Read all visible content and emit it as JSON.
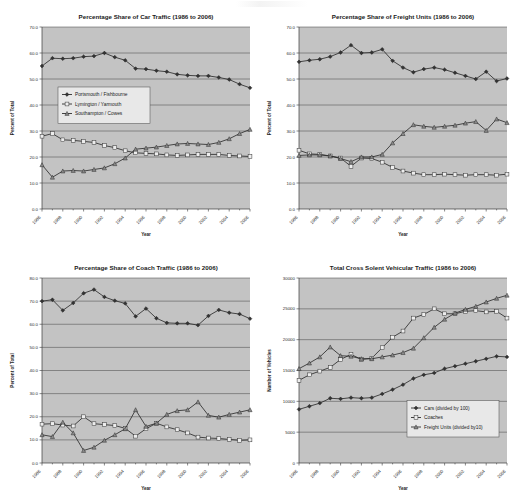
{
  "figure": {
    "name": "cross-solent-traffic-figure",
    "panel_count": 4
  },
  "series_styles": {
    "portsmouth": {
      "marker": "diamond",
      "fill": "#333333",
      "stroke": "#222222"
    },
    "lymington": {
      "marker": "square",
      "fill": "#ededed",
      "stroke": "#333333"
    },
    "southampton": {
      "marker": "triangle",
      "fill": "#8a8a8a",
      "stroke": "#222222"
    }
  },
  "charts": [
    {
      "id": "car-traffic",
      "type": "line",
      "title": "Percentage Share of Car Traffic (1986 to 2006)",
      "xlabel": "Year",
      "ylabel": "Percent of Total",
      "ylim": [
        0,
        70
      ],
      "ytick_step": 10,
      "ytick_labels": [
        "0.0",
        "10.0",
        "20.0",
        "30.0",
        "40.0",
        "50.0",
        "60.0",
        "70.0"
      ],
      "x": [
        1986,
        1987,
        1988,
        1989,
        1990,
        1991,
        1992,
        1993,
        1994,
        1995,
        1996,
        1997,
        1998,
        1999,
        2000,
        2001,
        2002,
        2003,
        2004,
        2005,
        2006
      ],
      "xtick_labels": [
        "1986",
        "1988",
        "1990",
        "1992",
        "1994",
        "1996",
        "1998",
        "2000",
        "2002",
        "2004",
        "2006"
      ],
      "grid": true,
      "legend_position": "upper-left-inside",
      "series": [
        {
          "name": "Portsmouth / Fishbourne",
          "style": "portsmouth",
          "values": [
            55.0,
            58.0,
            57.8,
            58.0,
            58.6,
            58.8,
            60.0,
            58.4,
            57.2,
            54.0,
            53.8,
            53.2,
            52.8,
            51.8,
            51.4,
            51.2,
            51.2,
            50.6,
            49.8,
            48.0,
            46.6
          ]
        },
        {
          "name": "Lymington / Yarmouth",
          "style": "lymington",
          "values": [
            28.0,
            29.0,
            26.6,
            26.4,
            26.0,
            25.6,
            24.4,
            23.6,
            22.4,
            21.6,
            21.4,
            21.2,
            20.8,
            20.6,
            20.8,
            21.0,
            21.0,
            21.0,
            20.6,
            20.4,
            20.2
          ]
        },
        {
          "name": "Southampton / Cowes",
          "style": "southampton",
          "values": [
            17.0,
            12.2,
            14.6,
            14.8,
            14.6,
            15.2,
            15.8,
            17.4,
            19.6,
            23.0,
            23.4,
            23.8,
            24.4,
            25.0,
            25.2,
            25.0,
            24.8,
            25.6,
            27.0,
            29.0,
            30.6
          ]
        }
      ]
    },
    {
      "id": "freight-units",
      "type": "line",
      "title": "Percentage Share of Freight Units (1986 to 2006)",
      "xlabel": "Year",
      "ylabel": "Percent of Total",
      "ylim": [
        0,
        70
      ],
      "ytick_step": 10,
      "ytick_labels": [
        "0.0",
        "10.0",
        "20.0",
        "30.0",
        "40.0",
        "50.0",
        "60.0",
        "70.0"
      ],
      "x": [
        1986,
        1987,
        1988,
        1989,
        1990,
        1991,
        1992,
        1993,
        1994,
        1995,
        1996,
        1997,
        1998,
        1999,
        2000,
        2001,
        2002,
        2003,
        2004,
        2005,
        2006
      ],
      "xtick_labels": [
        "1986",
        "1988",
        "1990",
        "1992",
        "1994",
        "1996",
        "1998",
        "2000",
        "2002",
        "2004",
        "2006"
      ],
      "grid": true,
      "legend_position": "none",
      "series": [
        {
          "name": "Portsmouth / Fishbourne",
          "style": "portsmouth",
          "values": [
            56.6,
            57.2,
            57.6,
            58.6,
            60.2,
            63.0,
            60.0,
            60.2,
            61.4,
            57.0,
            54.4,
            52.6,
            53.8,
            54.4,
            53.6,
            52.4,
            51.2,
            50.0,
            52.8,
            49.2,
            50.2
          ]
        },
        {
          "name": "Lymington / Yarmouth",
          "style": "lymington",
          "values": [
            22.6,
            21.2,
            21.0,
            20.4,
            19.6,
            16.4,
            19.6,
            19.4,
            18.0,
            16.0,
            14.6,
            13.8,
            13.2,
            13.2,
            13.4,
            13.2,
            13.0,
            13.2,
            13.2,
            13.0,
            13.4
          ]
        },
        {
          "name": "Southampton / Cowes",
          "style": "southampton",
          "values": [
            20.6,
            20.8,
            20.8,
            20.4,
            19.4,
            18.2,
            20.0,
            20.0,
            21.0,
            25.4,
            29.0,
            32.4,
            31.8,
            31.4,
            31.8,
            32.2,
            33.0,
            33.6,
            30.2,
            34.6,
            33.2
          ]
        }
      ]
    },
    {
      "id": "coach-traffic",
      "type": "line",
      "title": "Percentage Share of Coach Traffic (1986 to 2006)",
      "xlabel": "Year",
      "ylabel": "Percent of Total",
      "ylim": [
        0,
        80
      ],
      "ytick_step": 10,
      "ytick_labels": [
        "0.0",
        "10.0",
        "20.0",
        "30.0",
        "40.0",
        "50.0",
        "60.0",
        "70.0",
        "80.0"
      ],
      "x": [
        1986,
        1987,
        1988,
        1989,
        1990,
        1991,
        1992,
        1993,
        1994,
        1995,
        1996,
        1997,
        1998,
        1999,
        2000,
        2001,
        2002,
        2003,
        2004,
        2005,
        2006
      ],
      "xtick_labels": [
        "1986",
        "1988",
        "1990",
        "1992",
        "1994",
        "1996",
        "1998",
        "2000",
        "2002",
        "2004",
        "2006"
      ],
      "grid": true,
      "legend_position": "none",
      "series": [
        {
          "name": "Portsmouth / Fishbourne",
          "style": "portsmouth",
          "values": [
            70.0,
            70.6,
            66.0,
            69.2,
            73.4,
            75.0,
            71.8,
            70.2,
            69.0,
            63.4,
            66.8,
            62.6,
            60.6,
            60.4,
            60.4,
            59.6,
            63.6,
            66.2,
            65.0,
            64.4,
            62.4
          ]
        },
        {
          "name": "Lymington / Yarmouth",
          "style": "lymington",
          "values": [
            16.8,
            17.0,
            16.4,
            16.0,
            20.0,
            17.0,
            16.6,
            16.2,
            15.0,
            11.6,
            14.8,
            17.2,
            15.6,
            14.4,
            13.0,
            11.2,
            10.8,
            10.6,
            10.2,
            9.8,
            10.0
          ]
        },
        {
          "name": "Southampton / Cowes",
          "style": "southampton",
          "values": [
            12.2,
            11.4,
            17.6,
            13.0,
            5.4,
            6.8,
            9.8,
            12.2,
            14.8,
            23.0,
            15.8,
            17.2,
            21.0,
            22.6,
            23.0,
            26.4,
            20.6,
            19.8,
            21.0,
            22.0,
            23.0
          ]
        }
      ]
    },
    {
      "id": "total-vehicular-traffic",
      "type": "line",
      "title": "Total Cross Solent Vehicular Traffic (1986 to 2006)",
      "xlabel": "Year",
      "ylabel": "Number of Vehicles",
      "ylim": [
        0,
        30000
      ],
      "ytick_step": 5000,
      "ytick_labels": [
        "0",
        "5000",
        "10000",
        "15000",
        "20000",
        "25000",
        "30000"
      ],
      "x": [
        1986,
        1987,
        1988,
        1989,
        1990,
        1991,
        1992,
        1993,
        1994,
        1995,
        1996,
        1997,
        1998,
        1999,
        2000,
        2001,
        2002,
        2003,
        2004,
        2005,
        2006
      ],
      "xtick_labels": [
        "1986",
        "1988",
        "1990",
        "1992",
        "1994",
        "1996",
        "1998",
        "2000",
        "2002",
        "2004",
        "2006"
      ],
      "grid": true,
      "legend_position": "lower-right-inside",
      "series": [
        {
          "name": "Cars (divided by 100)",
          "style": "portsmouth",
          "values": [
            8700,
            9200,
            9700,
            10500,
            10400,
            10600,
            10500,
            10600,
            11200,
            11900,
            12700,
            13700,
            14300,
            14600,
            15300,
            15700,
            16100,
            16500,
            16900,
            17300,
            17200
          ]
        },
        {
          "name": "Coaches",
          "style": "lymington",
          "values": [
            13400,
            14300,
            14900,
            15500,
            16800,
            17600,
            16800,
            17000,
            18700,
            20400,
            21400,
            23500,
            24100,
            25000,
            24200,
            24200,
            24600,
            24700,
            24500,
            24600,
            23500
          ]
        },
        {
          "name": "Freight Units (divided by10)",
          "style": "southampton",
          "values": [
            15300,
            16200,
            17200,
            18800,
            17400,
            17300,
            16900,
            16900,
            17200,
            17500,
            17900,
            18600,
            20300,
            22000,
            23300,
            24300,
            24900,
            25400,
            26100,
            26700,
            27200
          ]
        }
      ]
    }
  ]
}
